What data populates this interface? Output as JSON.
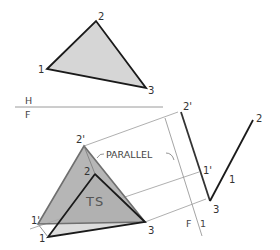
{
  "diagram": {
    "colors": {
      "background": "#ffffff",
      "line": "#1a1a1a",
      "thin_line": "#9a9a9a",
      "top_fill": "#d6d6d6",
      "front_revolved_fill": "#a9a9a9",
      "front_original_fill": "#dcdcdc"
    },
    "fold_lines": [
      {
        "id": "hf",
        "upper_label": "H",
        "lower_label": "F"
      },
      {
        "id": "f1",
        "left_label": "F",
        "right_label": "1"
      }
    ],
    "top_view": {
      "vertices": [
        {
          "label": "1",
          "x": 47,
          "y": 69
        },
        {
          "label": "2",
          "x": 96,
          "y": 21
        },
        {
          "label": "3",
          "x": 146,
          "y": 88
        }
      ]
    },
    "front_view": {
      "vertices": [
        {
          "label": "1",
          "x": 48,
          "y": 237
        },
        {
          "label": "2",
          "x": 95,
          "y": 174
        },
        {
          "label": "3",
          "x": 145,
          "y": 222
        }
      ],
      "revolved_vertices": [
        {
          "label": "1'",
          "x": 38,
          "y": 224
        },
        {
          "label": "2'",
          "x": 84,
          "y": 146
        },
        {
          "label": "3",
          "x": 145,
          "y": 222
        }
      ],
      "ts_label": "TS",
      "annotation": "PARALLEL"
    },
    "auxiliary_view": {
      "edge_view": [
        {
          "label": "3",
          "x": 210,
          "y": 201
        },
        {
          "label": "1",
          "x": 226,
          "y": 173
        },
        {
          "label": "2",
          "x": 253,
          "y": 120
        }
      ],
      "revolved_edge_view": [
        {
          "label": "2'",
          "x": 181,
          "y": 112
        },
        {
          "label": "1'",
          "x": 201,
          "y": 172
        },
        {
          "label": "3",
          "x": 210,
          "y": 201
        }
      ]
    }
  }
}
